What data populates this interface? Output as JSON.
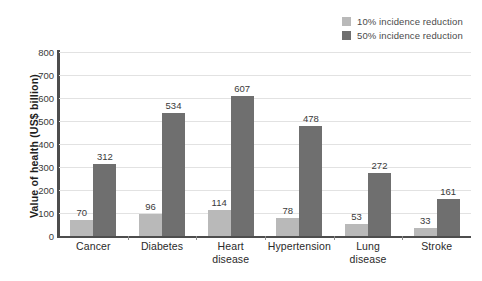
{
  "chart_data": {
    "type": "bar",
    "title": "",
    "subtitle": "",
    "xlabel": "",
    "ylabel": "Value of health (US$ billion)",
    "ylim": [
      0,
      800
    ],
    "ytick_labels": [
      "800",
      "700",
      "600",
      "500",
      "400",
      "300",
      "200",
      "100",
      "0"
    ],
    "ytick_values": [
      800,
      700,
      600,
      500,
      400,
      300,
      200,
      100,
      0
    ],
    "grid": true,
    "grid_axis": "y",
    "legend_position": "top-right",
    "categories": [
      "Cancer",
      "Diabetes",
      "Heart disease",
      "Hypertension",
      "Lung disease",
      "Stroke"
    ],
    "category_lines": [
      [
        "Cancer"
      ],
      [
        "Diabetes"
      ],
      [
        "Heart",
        "disease"
      ],
      [
        "Hypertension"
      ],
      [
        "Lung",
        "disease"
      ],
      [
        "Stroke"
      ]
    ],
    "series": [
      {
        "name": "10% incidence reduction",
        "color": "#b9b9b9",
        "values": [
          70,
          96,
          114,
          78,
          53,
          33
        ]
      },
      {
        "name": "50% incidence reduction",
        "color": "#6f6f6f",
        "values": [
          312,
          534,
          607,
          478,
          272,
          161
        ]
      }
    ]
  },
  "legend": {
    "items": [
      {
        "label": "10% incidence reduction",
        "color": "#b9b9b9"
      },
      {
        "label": "50% incidence reduction",
        "color": "#6f6f6f"
      }
    ]
  },
  "axes": {
    "y_title": "Value of health (US$ billion)"
  },
  "colors": {
    "series_light": "#b9b9b9",
    "series_dark": "#6f6f6f",
    "axis_line": "#4d4d4d",
    "gridline": "#e2e2e2",
    "text": "#3a3a3a"
  }
}
